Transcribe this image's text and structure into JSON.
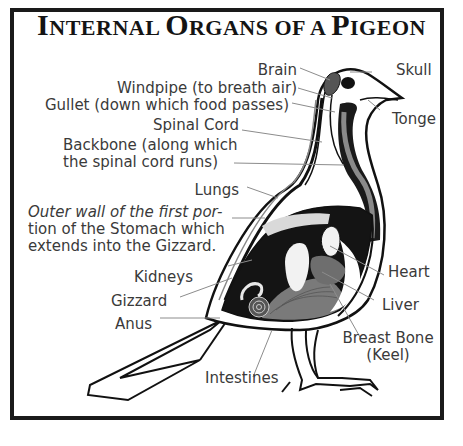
{
  "title": {
    "word1_cap": "I",
    "word1_rest": "NTERNAL ",
    "word2_cap": "O",
    "word2_rest": "RGANS OF A ",
    "word3_cap": "P",
    "word3_rest": "IGEON",
    "full": "INTERNAL ORGANS OF A PIGEON"
  },
  "labels": {
    "brain": "Brain",
    "windpipe": "Windpipe (to breath air)",
    "gullet": "Gullet (down which food passes)",
    "spinal_cord": "Spinal Cord",
    "backbone_line1": "Backbone (along which",
    "backbone_line2": "the spinal cord runs)",
    "lungs": "Lungs",
    "stomach_line1": "Outer wall of the first por-",
    "stomach_line2": "tion of the Stomach which",
    "stomach_line3": "extends into the Gizzard.",
    "kidneys": "Kidneys",
    "gizzard": "Gizzard",
    "anus": "Anus",
    "intestines": "Intestines",
    "skull": "Skull",
    "tonge": "Tonge",
    "heart": "Heart",
    "liver": "Liver",
    "breast_bone_line1": "Breast Bone",
    "breast_bone_line2": "(Keel)"
  },
  "colors": {
    "border": "#1a1a1a",
    "text": "#3a3a3a",
    "organ_dark": "#111111",
    "organ_gray": "#8a8a8a",
    "leader": "#8c8c8c"
  }
}
